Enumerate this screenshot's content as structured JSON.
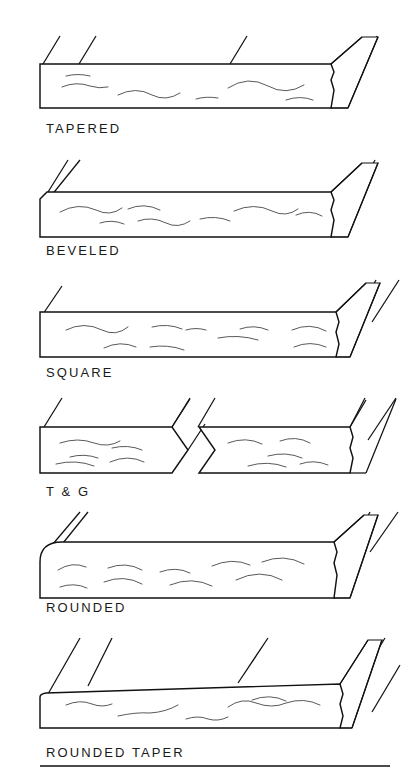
{
  "figure": {
    "background_color": "#ffffff",
    "line_color": "#111111",
    "width": 417,
    "height": 769,
    "has_bottom_rule": true
  },
  "panels": [
    {
      "id": "tapered",
      "label": "TAPERED",
      "edge_type": "tapered",
      "description": "Board with tapered long edge, two hatch lines at left edge",
      "label_x": 46,
      "label_y": 133,
      "body": {
        "x": 40,
        "y": 62,
        "width": 315,
        "height": 45
      },
      "hatch_count": 4,
      "tilt": 0
    },
    {
      "id": "beveled",
      "label": "BEVELED",
      "edge_type": "beveled",
      "description": "Board with chamfered bevel at top-left corner",
      "label_x": 46,
      "label_y": 255,
      "body": {
        "x": 40,
        "y": 192,
        "width": 315,
        "height": 45
      },
      "hatch_count": 3,
      "tilt": 0
    },
    {
      "id": "square",
      "label": "SQUARE",
      "edge_type": "square",
      "description": "Board with plain square cut edge",
      "label_x": 46,
      "label_y": 377,
      "body": {
        "x": 40,
        "y": 312,
        "width": 315,
        "height": 45
      },
      "hatch_count": 3,
      "tilt": 0
    },
    {
      "id": "tongue-and-groove",
      "label": "T & G",
      "edge_type": "tongue-and-groove",
      "description": "Two board segments, left ends in a V tongue, right has a V groove notch",
      "label_x": 46,
      "label_y": 496,
      "body": {
        "x": 40,
        "y": 425,
        "width": 315,
        "height": 45
      },
      "hatch_count": 4,
      "tilt": 0
    },
    {
      "id": "rounded",
      "label": "ROUNDED",
      "edge_type": "rounded",
      "description": "Board with rounded bullnose left edge",
      "label_x": 46,
      "label_y": 612,
      "body": {
        "x": 40,
        "y": 540,
        "width": 315,
        "height": 45
      },
      "hatch_count": 3,
      "tilt": 0
    },
    {
      "id": "rounded-taper",
      "label": "ROUNDED  TAPER",
      "edge_type": "rounded-taper",
      "description": "Board with rounded tapered edge, drawn at slight upward tilt",
      "label_x": 46,
      "label_y": 757,
      "body": {
        "x": 40,
        "y": 672,
        "width": 315,
        "height": 45
      },
      "hatch_count": 4,
      "tilt": 4
    }
  ]
}
